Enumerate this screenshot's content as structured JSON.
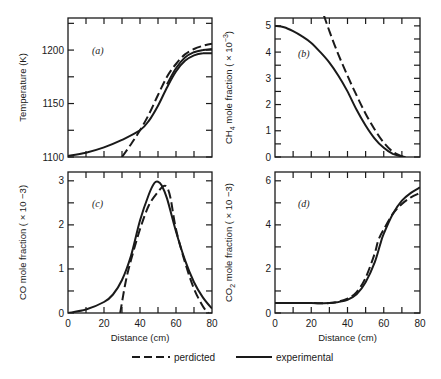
{
  "chart_data": [
    {
      "type": "line",
      "panel": "(a)",
      "title": "",
      "xlabel": "",
      "ylabel": "Temperature (K)",
      "xlim": [
        0,
        80
      ],
      "ylim": [
        1100,
        1230
      ],
      "yticks": [
        "1100",
        "1150",
        "1200"
      ],
      "xticks": [],
      "series": [
        {
          "name": "experimental",
          "style": "solid",
          "x": [
            0,
            10,
            20,
            30,
            40,
            45,
            50,
            55,
            60,
            65,
            70,
            75,
            80
          ],
          "y": [
            1101,
            1104,
            1109,
            1116,
            1125,
            1134,
            1148,
            1165,
            1180,
            1190,
            1195,
            1197,
            1197
          ]
        },
        {
          "name": "perdicted",
          "style": "dashed",
          "x": [
            30,
            35,
            40,
            45,
            50,
            55,
            60,
            65,
            70,
            75,
            80
          ],
          "y": [
            1100,
            1112,
            1125,
            1140,
            1158,
            1175,
            1187,
            1196,
            1201,
            1204,
            1206
          ]
        },
        {
          "name": "experimental-2",
          "style": "solid",
          "x": [
            55,
            60,
            65,
            70,
            75,
            80
          ],
          "y": [
            1168,
            1183,
            1193,
            1198,
            1200,
            1201
          ]
        }
      ]
    },
    {
      "type": "line",
      "panel": "(b)",
      "ylabel": "CH4 mole fraction (× 10^-3)",
      "xlim": [
        0,
        80
      ],
      "ylim": [
        0,
        5.3
      ],
      "yticks": [
        "0",
        "1",
        "2",
        "3",
        "4",
        "5"
      ],
      "xticks": [],
      "series": [
        {
          "name": "experimental",
          "style": "solid",
          "x": [
            0,
            5,
            10,
            15,
            20,
            25,
            30,
            35,
            40,
            45,
            50,
            55,
            60,
            65,
            70,
            72
          ],
          "y": [
            5.0,
            4.95,
            4.8,
            4.6,
            4.35,
            4.0,
            3.6,
            3.1,
            2.5,
            1.8,
            1.2,
            0.7,
            0.35,
            0.12,
            0.02,
            0.0
          ]
        },
        {
          "name": "perdicted",
          "style": "dashed",
          "x": [
            27,
            30,
            35,
            40,
            45,
            50,
            55,
            60,
            65,
            70,
            72
          ],
          "y": [
            5.4,
            4.8,
            3.9,
            3.1,
            2.35,
            1.65,
            1.05,
            0.55,
            0.2,
            0.03,
            0.0
          ]
        }
      ]
    },
    {
      "type": "line",
      "panel": "(c)",
      "xlabel": "Distance (cm)",
      "ylabel": "CO mole fraction (× 10^-3)",
      "xlim": [
        0,
        80
      ],
      "ylim": [
        0,
        3.2
      ],
      "xticks": [
        "0",
        "20",
        "40",
        "60",
        "80"
      ],
      "yticks": [
        "0",
        "1",
        "2",
        "3"
      ],
      "series": [
        {
          "name": "experimental",
          "style": "solid",
          "x": [
            0,
            10,
            20,
            25,
            30,
            35,
            40,
            45,
            48,
            50,
            52,
            55,
            60,
            65,
            70,
            75,
            80
          ],
          "y": [
            0.0,
            0.08,
            0.25,
            0.42,
            0.75,
            1.3,
            2.1,
            2.7,
            2.95,
            2.98,
            2.9,
            2.6,
            1.85,
            1.2,
            0.7,
            0.35,
            0.1
          ]
        },
        {
          "name": "perdicted",
          "style": "dashed",
          "x": [
            29,
            32,
            35,
            40,
            45,
            50,
            53,
            55,
            57,
            60,
            65,
            70,
            75,
            78
          ],
          "y": [
            0.0,
            0.7,
            1.2,
            1.9,
            2.45,
            2.75,
            2.88,
            2.85,
            2.6,
            1.9,
            1.15,
            0.55,
            0.15,
            0.0
          ]
        }
      ]
    },
    {
      "type": "line",
      "panel": "(d)",
      "xlabel": "Distance (cm)",
      "ylabel": "CO2 mole fraction (× 10^-3)",
      "xlim": [
        0,
        80
      ],
      "ylim": [
        0,
        6.4
      ],
      "xticks": [
        "0",
        "20",
        "40",
        "60",
        "80"
      ],
      "yticks": [
        "0",
        "2",
        "4",
        "6"
      ],
      "series": [
        {
          "name": "experimental",
          "style": "solid",
          "x": [
            0,
            10,
            20,
            30,
            35,
            40,
            45,
            50,
            55,
            58,
            60,
            65,
            70,
            75,
            80
          ],
          "y": [
            0.45,
            0.45,
            0.45,
            0.45,
            0.5,
            0.6,
            0.85,
            1.4,
            2.3,
            3.1,
            3.6,
            4.5,
            5.1,
            5.45,
            5.7
          ]
        },
        {
          "name": "perdicted",
          "style": "dashed",
          "x": [
            0,
            10,
            20,
            30,
            35,
            40,
            45,
            50,
            55,
            57,
            60,
            65,
            70,
            75,
            80
          ],
          "y": [
            0.45,
            0.45,
            0.45,
            0.45,
            0.52,
            0.65,
            0.95,
            1.6,
            2.7,
            3.3,
            3.8,
            4.5,
            4.95,
            5.25,
            5.45
          ]
        }
      ]
    }
  ],
  "figure": {
    "panels": [
      {
        "tag": "(a)",
        "ylabel": "Temperature (K)",
        "yticks": [
          "1100",
          "1150",
          "1200"
        ]
      },
      {
        "tag": "(b)",
        "ylabel_main": "CH",
        "ylabel_sub": "4",
        "ylabel_rest": " mole fraction ( × 10",
        "ylabel_sup": "−3",
        "ylabel_end": ")",
        "yticks": [
          "0",
          "1",
          "2",
          "3",
          "4",
          "5"
        ]
      },
      {
        "tag": "(c)",
        "ylabel": "CO mole fraction ( × 10 −3)",
        "yticks": [
          "0",
          "1",
          "2",
          "3"
        ],
        "xticks": [
          "0",
          "20",
          "40",
          "60",
          "80"
        ],
        "xlabel": "Distance (cm)"
      },
      {
        "tag": "(d)",
        "ylabel_main": "CO",
        "ylabel_sub": "2",
        "ylabel_rest": " mole fraction ( × 10 −3)",
        "yticks": [
          "0",
          "2",
          "4",
          "6"
        ],
        "xticks": [
          "0",
          "20",
          "40",
          "60",
          "80"
        ],
        "xlabel": "Distance (cm)"
      }
    ],
    "legend": {
      "predicted_label": "perdicted",
      "experimental_label": "experimental"
    }
  }
}
